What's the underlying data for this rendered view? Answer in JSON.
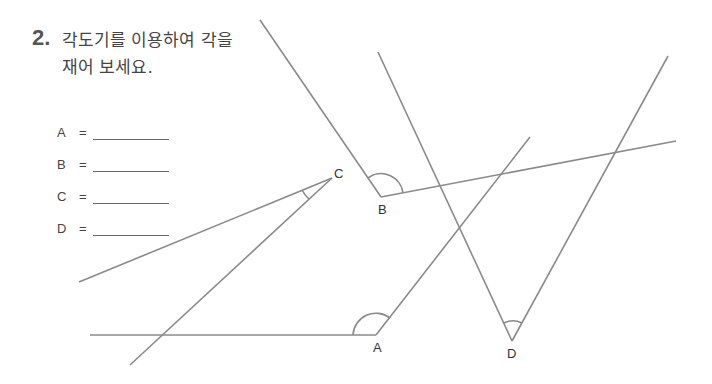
{
  "question": {
    "number": "2.",
    "text_line1": "각도기를 이용하여 각을",
    "text_line2": "재어 보세요."
  },
  "answers": [
    {
      "label": "A",
      "eq": "=",
      "value": ""
    },
    {
      "label": "B",
      "eq": "=",
      "value": ""
    },
    {
      "label": "C",
      "eq": "=",
      "value": ""
    },
    {
      "label": "D",
      "eq": "=",
      "value": ""
    }
  ],
  "vertices": {
    "A": "A",
    "B": "B",
    "C": "C",
    "D": "D"
  },
  "colors": {
    "line": "#8a8a8a",
    "text": "#444444"
  }
}
